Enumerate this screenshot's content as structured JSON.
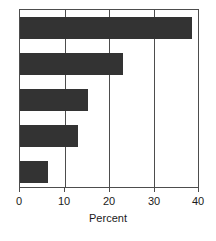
{
  "chart_data": {
    "type": "bar",
    "orientation": "horizontal",
    "title": "",
    "subtitle": "",
    "xlabel": "Percent",
    "ylabel": "",
    "categories": [
      "",
      "",
      "",
      "",
      ""
    ],
    "values": [
      38.7,
      23.1,
      15.3,
      13.1,
      6.2
    ],
    "xlim": [
      0,
      40
    ],
    "xticks": [
      0,
      10,
      20,
      30,
      40
    ],
    "xtick_labels": [
      "0",
      "10",
      "20",
      "30",
      "40"
    ],
    "yticks": [],
    "ytick_labels": [],
    "grid": "vertical",
    "legend": null,
    "annotations": [],
    "bar_color": "#333333",
    "frame_color": "#4d4d4d",
    "background_color": "#ffffff"
  },
  "axis": {
    "x_title": "Percent",
    "tick_0": "0",
    "tick_1": "10",
    "tick_2": "20",
    "tick_3": "30",
    "tick_4": "40"
  }
}
